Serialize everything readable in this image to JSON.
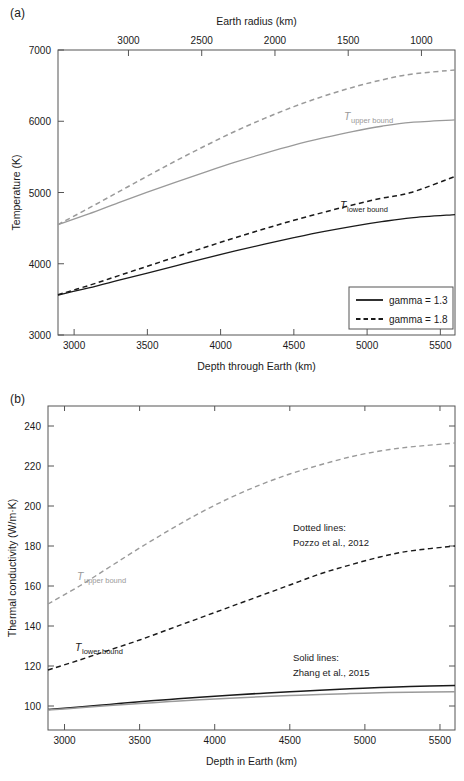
{
  "figure": {
    "panel_a_letter": "(a)",
    "panel_b_letter": "(b)"
  },
  "colors": {
    "upper_bound": "#9a9a9a",
    "lower_bound": "#1a1a1a",
    "frame": "#555555",
    "text": "#1a1a1a"
  },
  "panel_a": {
    "top_axis_title": "Earth radius (km)",
    "bottom_axis_title": "Depth through Earth (km)",
    "y_axis_title": "Temperature (K)",
    "top_ticks": [
      "3000",
      "2500",
      "2000",
      "1500",
      "1000",
      "500",
      "0"
    ],
    "bottom_ticks": [
      "3000",
      "3500",
      "4000",
      "4500",
      "5000",
      "5500"
    ],
    "y_ticks": [
      "7000",
      "6000",
      "5000",
      "4000",
      "3000"
    ],
    "label_upper_main": "T",
    "label_upper_sub": "upper bound",
    "label_lower_main": "T",
    "label_lower_sub": "lower bound",
    "legend": {
      "items": [
        {
          "label": "gamma = 1.3",
          "style": "solid"
        },
        {
          "label": "gamma = 1.8",
          "style": "dashed"
        }
      ]
    }
  },
  "panel_b": {
    "bottom_axis_title": "Depth in Earth (km)",
    "y_axis_title": "Thermal conductivity (W/m·K)",
    "bottom_ticks": [
      "3000",
      "3500",
      "4000",
      "4500",
      "5000",
      "5500"
    ],
    "y_ticks": [
      "240",
      "220",
      "200",
      "180",
      "160",
      "140",
      "120",
      "100"
    ],
    "label_upper_main": "T",
    "label_upper_sub": "upper bound",
    "label_lower_main": "T",
    "label_lower_sub": "lower bound",
    "annotation_dotted_line1": "Dotted lines:",
    "annotation_dotted_line2": "Pozzo et al., 2012",
    "annotation_solid_line1": "Solid lines:",
    "annotation_solid_line2": "Zhang et al., 2015"
  },
  "chart_data": [
    {
      "type": "line",
      "panel": "(a)",
      "title": "",
      "xlabel": "Depth through Earth (km)",
      "ylabel": "Temperature (K)",
      "secondary_xlabel": "Earth radius (km)",
      "xlim": [
        2890,
        5600
      ],
      "ylim": [
        3000,
        7000
      ],
      "secondary_xlim": [
        3381,
        671
      ],
      "xticks": [
        3000,
        3500,
        4000,
        4500,
        5000,
        5500
      ],
      "yticks": [
        3000,
        4000,
        5000,
        6000,
        7000
      ],
      "secondary_xticks": [
        3000,
        2500,
        2000,
        1500,
        1000,
        500,
        0
      ],
      "grid": false,
      "legend_position": "lower right",
      "legend_entries": [
        "gamma = 1.3",
        "gamma = 1.8"
      ],
      "x": [
        2890,
        3100,
        3300,
        3500,
        3700,
        3900,
        4100,
        4300,
        4500,
        4700,
        4900,
        5100,
        5300,
        5600
      ],
      "series": [
        {
          "name": "T_upper bound, gamma = 1.3",
          "style": "solid",
          "color": "#9a9a9a",
          "values": [
            4550,
            4700,
            4855,
            5005,
            5150,
            5290,
            5425,
            5550,
            5665,
            5765,
            5855,
            5930,
            5985,
            6020
          ]
        },
        {
          "name": "T_upper bound, gamma = 1.8",
          "style": "dashed",
          "color": "#9a9a9a",
          "values": [
            4550,
            4780,
            5005,
            5230,
            5450,
            5660,
            5860,
            6040,
            6205,
            6350,
            6475,
            6580,
            6660,
            6720
          ]
        },
        {
          "name": "T_lower bound, gamma = 1.3",
          "style": "solid",
          "color": "#1a1a1a",
          "values": [
            3560,
            3660,
            3765,
            3870,
            3975,
            4080,
            4180,
            4275,
            4365,
            4450,
            4525,
            4590,
            4645,
            4690
          ]
        },
        {
          "name": "T_lower bound, gamma = 1.8",
          "style": "dashed",
          "color": "#1a1a1a",
          "values": [
            3565,
            3695,
            3830,
            3965,
            4100,
            4235,
            4365,
            4490,
            4610,
            4720,
            4825,
            4920,
            5000,
            5225
          ]
        }
      ]
    },
    {
      "type": "line",
      "panel": "(b)",
      "title": "",
      "xlabel": "Depth in Earth (km)",
      "ylabel": "Thermal conductivity (W/m·K)",
      "xlim": [
        2890,
        5600
      ],
      "ylim": [
        88,
        250
      ],
      "xticks": [
        3000,
        3500,
        4000,
        4500,
        5000,
        5500
      ],
      "yticks": [
        100,
        120,
        140,
        160,
        180,
        200,
        220,
        240
      ],
      "grid": false,
      "annotations": [
        "Dotted lines: Pozzo et al., 2012",
        "Solid lines: Zhang et al., 2015"
      ],
      "x": [
        2890,
        3100,
        3300,
        3500,
        3700,
        3900,
        4100,
        4300,
        4500,
        4700,
        4900,
        5100,
        5300,
        5600
      ],
      "series": [
        {
          "name": "T_upper bound, Pozzo et al., 2012",
          "style": "dashed",
          "color": "#9a9a9a",
          "values": [
            151,
            160,
            169.5,
            179,
            188,
            196.5,
            204,
            210.5,
            216,
            220.5,
            224.5,
            227.5,
            229.5,
            231.5
          ]
        },
        {
          "name": "T_lower bound, Pozzo et al., 2012",
          "style": "dashed",
          "color": "#1a1a1a",
          "values": [
            118,
            123,
            128,
            133,
            138.5,
            144,
            149.5,
            155,
            160.5,
            166,
            170.5,
            174.5,
            177.5,
            180
          ]
        },
        {
          "name": "T_lower bound, Zhang et al., 2015",
          "style": "solid",
          "color": "#1a1a1a",
          "values": [
            98.2,
            99.5,
            100.8,
            102.1,
            103.3,
            104.4,
            105.4,
            106.3,
            107.1,
            107.9,
            108.6,
            109.2,
            109.7,
            110.3
          ]
        },
        {
          "name": "T_upper bound, Zhang et al., 2015",
          "style": "solid",
          "color": "#9a9a9a",
          "values": [
            98.0,
            99.1,
            100.2,
            101.2,
            102.2,
            103.1,
            103.9,
            104.6,
            105.2,
            105.8,
            106.2,
            106.6,
            106.9,
            107.1
          ]
        }
      ]
    }
  ]
}
